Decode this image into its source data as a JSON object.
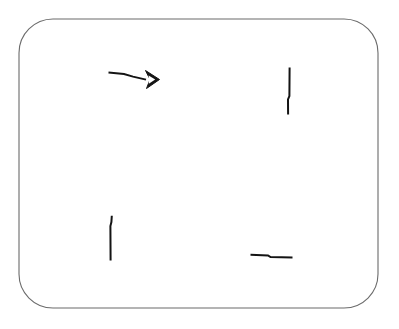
{
  "page": {
    "width": 399,
    "height": 329,
    "background_color": "#ffffff"
  },
  "frame": {
    "name": "rounded-rectangle-border",
    "x": 19,
    "y": 19,
    "width": 359,
    "height": 289,
    "corner_radius": 34,
    "stroke_color": "#6b6b6b",
    "stroke_width": 1.1
  },
  "ink": {
    "color": "#141414",
    "marks": [
      {
        "id": "arrow-right",
        "label": "Arrow pointing right",
        "type": "arrow",
        "shaft": "M 108.5,72.6 L 124,74.0 L 133,76.6 L 146,79.6",
        "shaft_width": 2.0,
        "head_points": "145.5,70.5 159.5,79.5 146.5,88.5 150.0,79.5",
        "head_inner": "148.0,74.8 155.8,79.6 148.2,84.4",
        "head_width": 2.2
      },
      {
        "id": "tick-right-upper",
        "label": "Vertical stroke, upper right",
        "type": "stroke",
        "path": "M 289.6,67.5 L 289.4,96.0 L 288.0,99.5 L 288.1,114.5",
        "width": 2.0
      },
      {
        "id": "tick-left-lower",
        "label": "Vertical stroke, lower left",
        "type": "stroke",
        "path": "M 111.8,215.8 L 111.4,222.0 L 110.4,226.0 L 110.6,260.5",
        "width": 2.0
      },
      {
        "id": "tick-bottom-horizontal",
        "label": "Horizontal stroke, lower right",
        "type": "stroke",
        "path": "M 250.5,254.8 L 268.0,255.4 L 270.5,257.1 L 292.5,257.4",
        "width": 2.0
      }
    ]
  }
}
